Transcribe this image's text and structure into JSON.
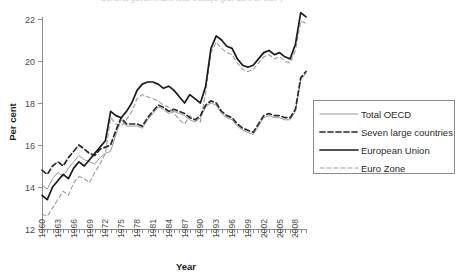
{
  "figure": {
    "clipped_title": "General government total outlays (per cent of GDP)",
    "plot": {
      "left": 42,
      "right": 306,
      "top": 19,
      "bottom": 229
    }
  },
  "chart_data": {
    "type": "line",
    "title": "",
    "xlabel": "Year",
    "ylabel": "Per cent",
    "xlim": [
      1960,
      2010
    ],
    "ylim": [
      12,
      22
    ],
    "yticks": [
      12,
      14,
      16,
      18,
      20,
      22
    ],
    "xticks": [
      1960,
      1963,
      1966,
      1969,
      1972,
      1975,
      1978,
      1981,
      1984,
      1987,
      1990,
      1993,
      1996,
      1999,
      2002,
      2005,
      2008
    ],
    "xtick_interval_minor": 1,
    "grid": false,
    "legend_position": "right",
    "x": [
      1960,
      1961,
      1962,
      1963,
      1964,
      1965,
      1966,
      1967,
      1968,
      1969,
      1970,
      1971,
      1972,
      1973,
      1974,
      1975,
      1976,
      1977,
      1978,
      1979,
      1980,
      1981,
      1982,
      1983,
      1984,
      1985,
      1986,
      1987,
      1988,
      1989,
      1990,
      1991,
      1992,
      1993,
      1994,
      1995,
      1996,
      1997,
      1998,
      1999,
      2000,
      2001,
      2002,
      2003,
      2004,
      2005,
      2006,
      2007,
      2008,
      2009,
      2010
    ],
    "series": [
      {
        "name": "Total OECD",
        "style": "thin-solid-grey",
        "color": "#9a9a9a",
        "values": [
          14.1,
          13.9,
          14.4,
          14.7,
          14.5,
          14.9,
          15.2,
          15.5,
          15.3,
          15.2,
          15.1,
          15.4,
          15.6,
          15.7,
          16.5,
          17.2,
          16.9,
          16.9,
          16.9,
          16.8,
          17.2,
          17.5,
          17.8,
          17.7,
          17.5,
          17.6,
          17.5,
          17.4,
          17.2,
          17.1,
          17.3,
          17.8,
          18.0,
          17.9,
          17.5,
          17.3,
          17.2,
          16.9,
          16.7,
          16.6,
          16.5,
          16.9,
          17.3,
          17.4,
          17.3,
          17.3,
          17.2,
          17.2,
          17.6,
          19.1,
          19.4
        ]
      },
      {
        "name": "Seven large countries",
        "style": "bold-dashed-dark",
        "color": "#2b2b2b",
        "values": [
          14.8,
          14.6,
          15.0,
          15.2,
          15.0,
          15.4,
          15.7,
          16.0,
          15.8,
          15.6,
          15.5,
          15.8,
          15.9,
          16.0,
          16.7,
          17.3,
          17.0,
          17.0,
          17.0,
          16.9,
          17.3,
          17.6,
          17.9,
          17.8,
          17.6,
          17.7,
          17.6,
          17.5,
          17.3,
          17.2,
          17.4,
          17.9,
          18.1,
          18.0,
          17.6,
          17.4,
          17.3,
          17.0,
          16.8,
          16.7,
          16.6,
          17.0,
          17.4,
          17.5,
          17.4,
          17.4,
          17.3,
          17.3,
          17.7,
          19.2,
          19.5
        ]
      },
      {
        "name": "European Union",
        "style": "thick-solid-black",
        "color": "#1a1a1a",
        "values": [
          13.6,
          13.4,
          14.0,
          14.3,
          14.6,
          14.4,
          14.9,
          15.2,
          15.0,
          15.3,
          15.6,
          15.9,
          16.2,
          17.6,
          17.4,
          17.3,
          17.6,
          18.0,
          18.6,
          18.9,
          19.0,
          19.0,
          18.9,
          18.7,
          18.8,
          18.6,
          18.3,
          18.0,
          18.4,
          18.2,
          18.0,
          18.8,
          20.6,
          21.2,
          21.0,
          20.7,
          20.6,
          20.1,
          19.8,
          19.7,
          19.8,
          20.1,
          20.4,
          20.5,
          20.3,
          20.4,
          20.2,
          20.1,
          20.8,
          22.3,
          22.1
        ]
      },
      {
        "name": "Euro Zone",
        "style": "thin-dashed-grey",
        "color": "#9a9a9a",
        "values": [
          12.7,
          12.6,
          13.0,
          13.4,
          13.8,
          13.6,
          14.2,
          14.5,
          14.4,
          14.2,
          14.7,
          15.1,
          15.6,
          17.3,
          17.0,
          16.9,
          17.2,
          17.6,
          18.2,
          18.4,
          18.3,
          18.2,
          18.1,
          17.9,
          17.8,
          17.5,
          17.2,
          17.0,
          17.4,
          17.2,
          17.1,
          18.5,
          20.4,
          20.9,
          20.6,
          20.4,
          20.3,
          19.9,
          19.6,
          19.5,
          19.6,
          19.9,
          20.2,
          20.3,
          20.1,
          20.2,
          20.0,
          19.9,
          20.5,
          21.9,
          21.8
        ]
      }
    ],
    "legend": [
      {
        "label": "Total OECD"
      },
      {
        "label": "Seven large countries"
      },
      {
        "label": "European Union"
      },
      {
        "label": "Euro Zone"
      }
    ]
  }
}
